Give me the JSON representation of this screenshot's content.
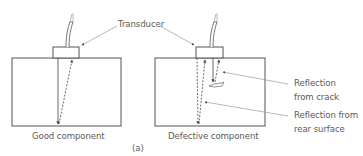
{
  "figure": {
    "caption": "(a)",
    "labels": {
      "transducer": "Transducer",
      "reflection_crack_line1": "Reflection",
      "reflection_crack_line2": "from crack",
      "reflection_rear_line1": "Reflection from",
      "reflection_rear_line2": "rear surface"
    },
    "panels": [
      {
        "name": "good",
        "title": "Good component"
      },
      {
        "name": "defective",
        "title": "Defective component"
      }
    ],
    "colors": {
      "line": "#555555",
      "leader": "#9a9a9a",
      "text": "#5a5a5a"
    }
  }
}
